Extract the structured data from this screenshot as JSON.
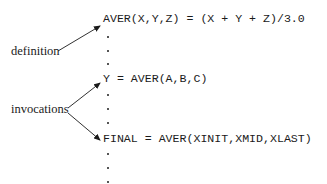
{
  "code_lines": {
    "definition": "AVER(X,Y,Z) = (X + Y + Z)/3.0",
    "invocation_1": "Y = AVER(A,B,C)",
    "invocation_2": "FINAL = AVER(XINIT,XMID,XLAST)"
  },
  "labels": {
    "definition": "definition",
    "invocations": "invocations"
  },
  "continuation_marker": "vertical ellipsis (three dots) between and after statements",
  "colors": {
    "text": "#1a1a1a",
    "background": "#ffffff"
  }
}
